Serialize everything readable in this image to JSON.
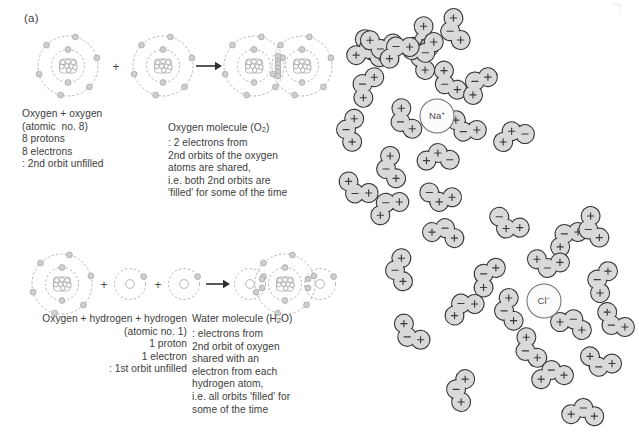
{
  "figure": {
    "panel_a_label": "(a)",
    "panel_b_label": "(b)"
  },
  "panel_a": {
    "row1": {
      "caption_left_lines": [
        "Oxygen + oxygen",
        "(atomic  no. 8)",
        "8 protons",
        "8 electrons",
        ": 2nd orbit unfilled"
      ],
      "caption_right_lines": [
        "Oxygen molecule (O₂)",
        ": 2 electrons from",
        "2nd orbits of the oxygen",
        "atoms are shared,",
        "i.e. both 2nd orbits are",
        "'filled' for some of the time"
      ],
      "operator_plus": "+",
      "reaction_arrow": "arrow-right-icon",
      "reactant_atoms": [
        "oxygen-atom",
        "oxygen-atom"
      ],
      "product": "oxygen-molecule-O2",
      "atom_structure": {
        "nucleus_nucleons": 8,
        "inner_orbit_electrons": 2,
        "outer_orbit_electrons": 6
      }
    },
    "row2": {
      "caption_left_lines": [
        "Oxygen + hydrogen + hydrogen",
        "(atomic no. 1)",
        "1 proton",
        "1 electron",
        ": 1st orbit unfilled"
      ],
      "caption_right_lines": [
        "Water molecule (H₂O)",
        ": electrons from",
        "2nd orbit of oxygen",
        "shared with an",
        "electron from each",
        "hydrogen atom,",
        "i.e. all orbits 'filled' for",
        "some of the time"
      ],
      "operator_plus": "+",
      "reaction_arrow": "arrow-right-icon",
      "reactant_atoms": [
        "oxygen-atom",
        "hydrogen-atom",
        "hydrogen-atom"
      ],
      "product": "water-molecule-H2O"
    }
  },
  "panel_b": {
    "ions": [
      {
        "name": "sodium-ion",
        "label": "Na",
        "charge": "+",
        "cx": 437,
        "cy": 116,
        "r": 17
      },
      {
        "name": "chloride-ion",
        "label": "Cl",
        "charge": "−",
        "cx": 544,
        "cy": 301,
        "r": 17
      }
    ],
    "colors": {
      "molecule_fill": "#d9d9d9",
      "molecule_stroke": "#3b3b3b",
      "ion_fill": "#fbfbfb",
      "ion_stroke": "#6f6f6f",
      "text": "#3d3d3d"
    },
    "molecule_count": 38,
    "molecules": [
      {
        "cx": 374,
        "cy": 47,
        "rot": 25,
        "marks": [
          "+",
          "−",
          "+"
        ]
      },
      {
        "cx": 421,
        "cy": 38,
        "rot": -62,
        "marks": [
          "+",
          "−",
          "+"
        ]
      },
      {
        "cx": 424,
        "cy": 58,
        "rot": 100,
        "marks": [
          "+",
          "−",
          "+"
        ]
      },
      {
        "cx": 368,
        "cy": 53,
        "rot": 185,
        "marks": [
          "+",
          "−",
          "+"
        ]
      },
      {
        "cx": 424,
        "cy": 49,
        "rot": -20,
        "marks": [
          "+",
          "−",
          "+"
        ]
      },
      {
        "cx": 381,
        "cy": 45,
        "rot": 8,
        "marks": [
          "+",
          "−",
          "+"
        ]
      },
      {
        "cx": 398,
        "cy": 50,
        "rot": 150,
        "marks": [
          "+",
          "−",
          "+"
        ]
      },
      {
        "cx": 454,
        "cy": 30,
        "rot": 72,
        "marks": [
          "+",
          "−",
          "+"
        ]
      },
      {
        "cx": 366,
        "cy": 86,
        "rot": 118,
        "marks": [
          "+",
          "−",
          "+"
        ]
      },
      {
        "cx": 448,
        "cy": 82,
        "rot": 55,
        "marks": [
          "+",
          "−",
          "+"
        ]
      },
      {
        "cx": 478,
        "cy": 84,
        "rot": 130,
        "marks": [
          "+",
          "−",
          "+"
        ]
      },
      {
        "cx": 350,
        "cy": 130,
        "rot": 95,
        "marks": [
          "+",
          "−",
          "+"
        ]
      },
      {
        "cx": 404,
        "cy": 120,
        "rot": 62,
        "marks": [
          "+",
          "−",
          "+"
        ]
      },
      {
        "cx": 465,
        "cy": 128,
        "rot": 25,
        "marks": [
          "+",
          "−",
          "+"
        ]
      },
      {
        "cx": 513,
        "cy": 135,
        "rot": 160,
        "marks": [
          "−",
          "+",
          "+"
        ]
      },
      {
        "cx": 390,
        "cy": 168,
        "rot": 75,
        "marks": [
          "+",
          "−",
          "+"
        ]
      },
      {
        "cx": 438,
        "cy": 157,
        "rot": 178,
        "marks": [
          "−",
          "+",
          "+"
        ]
      },
      {
        "cx": 440,
        "cy": 198,
        "rot": 12,
        "marks": [
          "−",
          "+",
          "+"
        ]
      },
      {
        "cx": 508,
        "cy": 225,
        "rot": 28,
        "marks": [
          "−",
          "+",
          "+"
        ]
      },
      {
        "cx": 567,
        "cy": 237,
        "rot": 140,
        "marks": [
          "+",
          "−",
          "+"
        ]
      },
      {
        "cx": 592,
        "cy": 228,
        "rot": 68,
        "marks": [
          "+",
          "−",
          "+"
        ]
      },
      {
        "cx": 548,
        "cy": 264,
        "rot": 8,
        "marks": [
          "+",
          "−",
          "+"
        ]
      },
      {
        "cx": 601,
        "cy": 281,
        "rot": 110,
        "marks": [
          "+",
          "−",
          "+"
        ]
      },
      {
        "cx": 487,
        "cy": 276,
        "rot": 122,
        "marks": [
          "+",
          "−",
          "+"
        ]
      },
      {
        "cx": 463,
        "cy": 307,
        "rot": 150,
        "marks": [
          "+",
          "−",
          "+"
        ]
      },
      {
        "cx": 508,
        "cy": 310,
        "rot": 78,
        "marks": [
          "+",
          "−",
          "+"
        ]
      },
      {
        "cx": 572,
        "cy": 323,
        "rot": 200,
        "marks": [
          "+",
          "−",
          "+"
        ]
      },
      {
        "cx": 614,
        "cy": 322,
        "rot": 40,
        "marks": [
          "+",
          "−",
          "+"
        ]
      },
      {
        "cx": 529,
        "cy": 349,
        "rot": 62,
        "marks": [
          "+",
          "−",
          "+"
        ]
      },
      {
        "cx": 552,
        "cy": 374,
        "rot": 170,
        "marks": [
          "+",
          "−",
          "+"
        ]
      },
      {
        "cx": 600,
        "cy": 363,
        "rot": 18,
        "marks": [
          "+",
          "−",
          "+"
        ]
      },
      {
        "cx": 460,
        "cy": 390,
        "rot": 100,
        "marks": [
          "+",
          "−",
          "+"
        ]
      },
      {
        "cx": 583,
        "cy": 412,
        "rot": 185,
        "marks": [
          "+",
          "−",
          "+"
        ]
      },
      {
        "cx": 410,
        "cy": 334,
        "rot": 44,
        "marks": [
          "+",
          "−",
          "+"
        ]
      },
      {
        "cx": 388,
        "cy": 206,
        "rot": 145,
        "marks": [
          "+",
          "−",
          "+"
        ]
      },
      {
        "cx": 357,
        "cy": 190,
        "rot": 30,
        "marks": [
          "+",
          "−",
          "+"
        ]
      },
      {
        "cx": 444,
        "cy": 232,
        "rot": 195,
        "marks": [
          "+",
          "−",
          "+"
        ]
      },
      {
        "cx": 399,
        "cy": 270,
        "rot": 86,
        "marks": [
          "+",
          "−",
          "+"
        ]
      }
    ]
  }
}
